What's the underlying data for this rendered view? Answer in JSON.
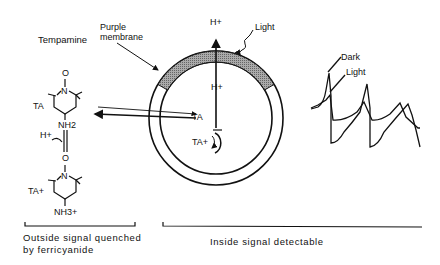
{
  "diagram": {
    "molecule": {
      "name": "Tempamine",
      "top_group_TA": "TA",
      "top_amine": "NH2",
      "proton": "H+",
      "bottom_group_TA": "TA+",
      "bottom_amine": "NH3+",
      "oxyl": "O"
    },
    "vesicle": {
      "membrane_label_line1": "Purple",
      "membrane_label_line2": "membrane",
      "light_label": "Light",
      "outer_proton": "H+",
      "inner_proton": "H+",
      "inner_TA": "TA",
      "inner_TA_plus": "TA+"
    },
    "traces": {
      "dark_label": "Dark",
      "light_label": "Light"
    },
    "captions": {
      "outside_line1": "Outside signal quenched",
      "outside_line2": "by ferricyanide",
      "inside": "Inside signal detectable"
    },
    "colors": {
      "ink": "#111111",
      "shade": "#888888",
      "background": "#ffffff"
    }
  }
}
